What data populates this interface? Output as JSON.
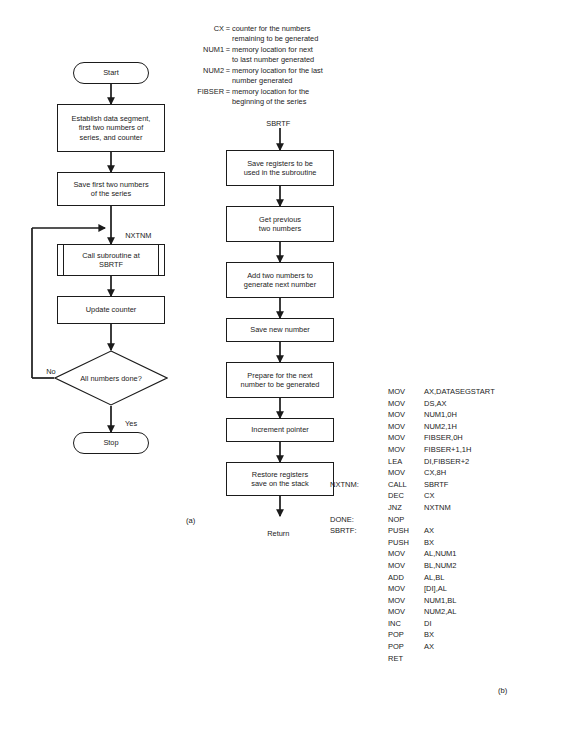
{
  "legend": {
    "rows": [
      {
        "name": "CX",
        "eq": "=",
        "line1": "counter for the numbers",
        "line2": "remaining to be generated"
      },
      {
        "name": "NUM1",
        "eq": "=",
        "line1": "memory location for next",
        "line2": "to last number generated"
      },
      {
        "name": "NUM2",
        "eq": "=",
        "line1": "memory location for the last",
        "line2": "number generated"
      },
      {
        "name": "FIBSER",
        "eq": "=",
        "line1": "memory location for the",
        "line2": "beginning of the series"
      }
    ]
  },
  "flowchart_main": {
    "start_label": "Start",
    "box_establish": "Establish data segment,\nfirst two numbers of\nseries, and counter",
    "box_save_first_two": "Save first two numbers\nof the series",
    "loop_label": "NXTNM",
    "box_call_subroutine": "Call subroutine at\nSBRTF",
    "box_update_counter": "Update counter",
    "decision_text": "All numbers done?",
    "branch_no": "No",
    "branch_yes": "Yes",
    "stop_label": "Stop",
    "caption": "(a)"
  },
  "flowchart_subroutine": {
    "entry_label": "SBRTF",
    "box_save_registers": "Save registers to be\nused in the subroutine",
    "box_get_previous": "Get previous\ntwo numbers",
    "box_add_two": "Add two numbers to\ngenerate next number",
    "box_save_new": "Save new number",
    "box_prepare_next": "Prepare for the next\nnumber to be generated",
    "box_increment_pointer": "Increment pointer",
    "box_restore_registers": "Restore registers\nsave on the stack",
    "return_label": "Return"
  },
  "code_listing": {
    "caption": "(b)",
    "lines": [
      {
        "label": "",
        "op": "MOV",
        "args": "AX,DATASEGSTART"
      },
      {
        "label": "",
        "op": "MOV",
        "args": "DS,AX"
      },
      {
        "label": "",
        "op": "MOV",
        "args": "NUM1,0H"
      },
      {
        "label": "",
        "op": "MOV",
        "args": "NUM2,1H"
      },
      {
        "label": "",
        "op": "MOV",
        "args": "FIBSER,0H"
      },
      {
        "label": "",
        "op": "MOV",
        "args": "FIBSER+1,1H"
      },
      {
        "label": "",
        "op": "LEA",
        "args": "DI,FIBSER+2"
      },
      {
        "label": "",
        "op": "MOV",
        "args": "CX,8H"
      },
      {
        "label": "NXTNM:",
        "op": "CALL",
        "args": "SBRTF"
      },
      {
        "label": "",
        "op": "DEC",
        "args": "CX"
      },
      {
        "label": "",
        "op": "JNZ",
        "args": "NXTNM"
      },
      {
        "label": "DONE:",
        "op": "NOP",
        "args": ""
      },
      {
        "label": "SBRTF:",
        "op": "PUSH",
        "args": "AX"
      },
      {
        "label": "",
        "op": "PUSH",
        "args": "BX"
      },
      {
        "label": "",
        "op": "MOV",
        "args": "AL,NUM1"
      },
      {
        "label": "",
        "op": "MOV",
        "args": "BL,NUM2"
      },
      {
        "label": "",
        "op": "ADD",
        "args": "AL,BL"
      },
      {
        "label": "",
        "op": "MOV",
        "args": "[DI],AL"
      },
      {
        "label": "",
        "op": "MOV",
        "args": "NUM1,BL"
      },
      {
        "label": "",
        "op": "MOV",
        "args": "NUM2,AL"
      },
      {
        "label": "",
        "op": "INC",
        "args": "DI"
      },
      {
        "label": "",
        "op": "POP",
        "args": "BX"
      },
      {
        "label": "",
        "op": "POP",
        "args": "AX"
      },
      {
        "label": "",
        "op": "RET",
        "args": ""
      }
    ]
  }
}
